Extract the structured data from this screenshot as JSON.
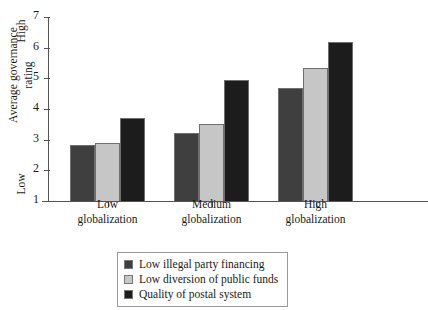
{
  "chart_data": {
    "type": "bar",
    "title": "",
    "xlabel": "",
    "ylabel": "Average governance rating",
    "ylim": [
      1,
      7
    ],
    "yticks": [
      1,
      2,
      3,
      4,
      5,
      6,
      7
    ],
    "y_axis_low_label": "Low",
    "y_axis_high_label": "High",
    "grid": false,
    "legend_position": "bottom",
    "categories": [
      "Low globalization",
      "Medium globalization",
      "High globalization"
    ],
    "series": [
      {
        "name": "Low illegal party financing",
        "color": "#3f3f3f",
        "values": [
          2.83,
          3.22,
          4.68
        ]
      },
      {
        "name": "Low diversion of public funds",
        "color": "#c6c6c6",
        "values": [
          2.88,
          3.52,
          5.35
        ]
      },
      {
        "name": "Quality of postal system",
        "color": "#1c1c1c",
        "values": [
          3.72,
          4.93,
          6.17
        ]
      }
    ]
  },
  "axis": {
    "y_title_line1": "Average governance",
    "y_title_line2": "rating",
    "y_tick_labels": [
      "7",
      "6",
      "5",
      "4",
      "3",
      "2",
      "1"
    ],
    "x_group_labels": [
      {
        "line1": "Low",
        "line2": "globalization"
      },
      {
        "line1": "Medium",
        "line2": "globalization"
      },
      {
        "line1": "High",
        "line2": "globalization"
      }
    ]
  },
  "legend": {
    "items": [
      {
        "label": "Low illegal party financing",
        "color": "#3f3f3f"
      },
      {
        "label": "Low diversion of public funds",
        "color": "#c6c6c6"
      },
      {
        "label": "Quality of postal system",
        "color": "#1c1c1c"
      }
    ]
  }
}
